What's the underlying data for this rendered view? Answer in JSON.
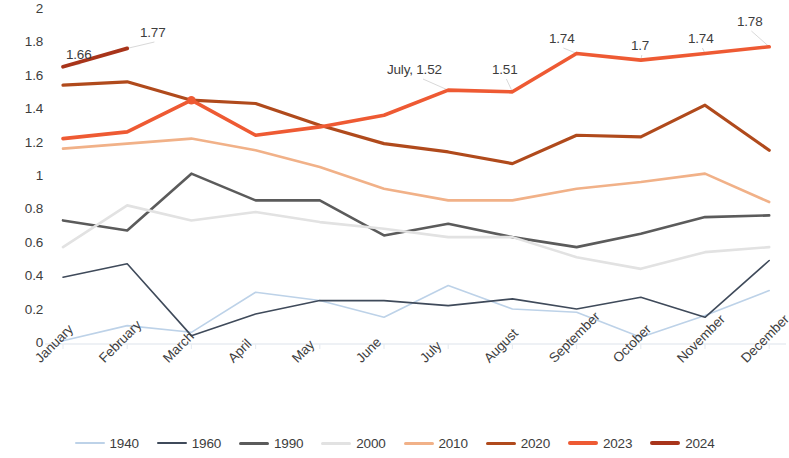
{
  "chart_data": {
    "type": "line",
    "title": "",
    "subtitle": "",
    "xlabel": "",
    "ylabel": "",
    "ylim": [
      0,
      2
    ],
    "yticks": [
      "0",
      "0.2",
      "0.4",
      "0.6",
      "0.8",
      "1",
      "1.2",
      "1.4",
      "1.6",
      "1.8",
      "2"
    ],
    "grid": false,
    "legend_position": "bottom",
    "categories": [
      "January",
      "February",
      "March",
      "April",
      "May",
      "June",
      "July",
      "August",
      "September",
      "October",
      "November",
      "December"
    ],
    "series": [
      {
        "name": "1940",
        "color": "#bdd2e8",
        "width": 1.6,
        "values": [
          0.02,
          0.11,
          0.07,
          0.31,
          0.26,
          0.16,
          0.35,
          0.21,
          0.19,
          0.04,
          0.17,
          0.32
        ]
      },
      {
        "name": "1960",
        "color": "#3f4a5a",
        "width": 1.6,
        "values": [
          0.4,
          0.48,
          0.05,
          0.18,
          0.26,
          0.26,
          0.23,
          0.27,
          0.21,
          0.28,
          0.16,
          0.5
        ]
      },
      {
        "name": "1990",
        "color": "#5b5b5b",
        "width": 2.6,
        "values": [
          0.74,
          0.68,
          1.02,
          0.86,
          0.86,
          0.65,
          0.72,
          0.64,
          0.58,
          0.66,
          0.76,
          0.77
        ]
      },
      {
        "name": "2000",
        "color": "#e2e2e2",
        "width": 2.6,
        "values": [
          0.58,
          0.83,
          0.74,
          0.79,
          0.73,
          0.69,
          0.64,
          0.64,
          0.52,
          0.45,
          0.55,
          0.58
        ]
      },
      {
        "name": "2010",
        "color": "#f1b188",
        "width": 2.6,
        "values": [
          1.17,
          1.2,
          1.23,
          1.16,
          1.06,
          0.93,
          0.86,
          0.86,
          0.93,
          0.97,
          1.02,
          0.85
        ]
      },
      {
        "name": "2020",
        "color": "#b04a1c",
        "width": 3.2,
        "values": [
          1.55,
          1.57,
          1.46,
          1.44,
          1.31,
          1.2,
          1.15,
          1.08,
          1.25,
          1.24,
          1.43,
          1.16
        ]
      },
      {
        "name": "2023",
        "color": "#ee5a33",
        "width": 3.6,
        "values": [
          1.23,
          1.27,
          1.46,
          1.25,
          1.3,
          1.37,
          1.52,
          1.51,
          1.74,
          1.7,
          1.74,
          1.78
        ]
      },
      {
        "name": "2024",
        "color": "#a8341a",
        "width": 3.8,
        "values": [
          1.66,
          1.77,
          null,
          null,
          null,
          null,
          null,
          null,
          null,
          null,
          null,
          null
        ]
      }
    ],
    "annotations": [
      {
        "text": "1.66",
        "series": "2024",
        "category": "January",
        "value": 1.66,
        "x": 66,
        "y": 47
      },
      {
        "text": "1.77",
        "series": "2024",
        "category": "February",
        "value": 1.77,
        "x": 140,
        "y": 25
      },
      {
        "text": "July, 1.52",
        "series": "2023",
        "category": "July",
        "value": 1.52,
        "x": 387,
        "y": 62
      },
      {
        "text": "1.51",
        "series": "2023",
        "category": "August",
        "value": 1.51,
        "x": 492,
        "y": 62
      },
      {
        "text": "1.74",
        "series": "2023",
        "category": "September",
        "value": 1.74,
        "x": 549,
        "y": 31
      },
      {
        "text": "1.7",
        "series": "2023",
        "category": "October",
        "value": 1.7,
        "x": 631,
        "y": 38
      },
      {
        "text": "1.74",
        "series": "2023",
        "category": "November",
        "value": 1.74,
        "x": 688,
        "y": 31
      },
      {
        "text": "1.78",
        "series": "2023",
        "category": "December",
        "value": 1.78,
        "x": 737,
        "y": 14
      }
    ]
  },
  "legend": {
    "items": [
      {
        "label": "1940",
        "color": "#bdd2e8"
      },
      {
        "label": "1960",
        "color": "#3f4a5a"
      },
      {
        "label": "1990",
        "color": "#5b5b5b"
      },
      {
        "label": "2000",
        "color": "#e2e2e2"
      },
      {
        "label": "2010",
        "color": "#f1b188"
      },
      {
        "label": "2020",
        "color": "#b04a1c"
      },
      {
        "label": "2023",
        "color": "#ee5a33"
      },
      {
        "label": "2024",
        "color": "#a8341a"
      }
    ]
  },
  "axis": {
    "baseline_color": "#e8edf2"
  }
}
